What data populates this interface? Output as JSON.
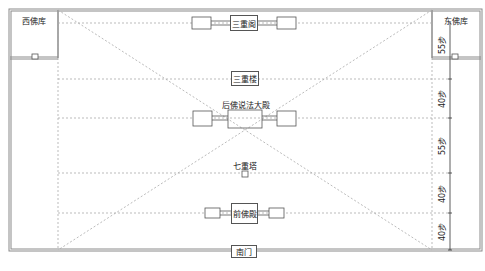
{
  "diagram": {
    "type": "temple-site-plan",
    "colors": {
      "frame": "#8a8a8a",
      "dashed": "#aaaaaa",
      "box_border": "#555555",
      "text": "#222222"
    },
    "buildings": {
      "west_store": "西佛库",
      "east_store": "东佛库",
      "three_story_pavilion": "三重阁",
      "three_story_tower": "三重楼",
      "rear_dharma_hall": "后佛说法大殿",
      "seven_story_pagoda": "七重塔",
      "front_buddha_hall": "前佛殿",
      "south_gate": "南门"
    },
    "dimensions": [
      {
        "label": "55步",
        "from_y": 10,
        "to_y": 79
      },
      {
        "label": "40步",
        "from_y": 79,
        "to_y": 118
      },
      {
        "label": "55步",
        "from_y": 118,
        "to_y": 173
      },
      {
        "label": "40步",
        "from_y": 173,
        "to_y": 213
      },
      {
        "label": "40步",
        "from_y": 213,
        "to_y": 250
      }
    ]
  }
}
